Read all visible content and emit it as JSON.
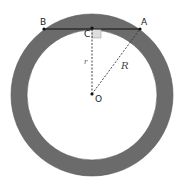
{
  "diagram": {
    "colors": {
      "ring": "#6b6b6b",
      "inner": "#ffffff",
      "stroke": "#111111",
      "right_angle": "#dddddd"
    },
    "points": {
      "A": "A",
      "B": "B",
      "C": "C",
      "O": "O"
    },
    "segments": {
      "r": "r",
      "R": "R"
    }
  }
}
